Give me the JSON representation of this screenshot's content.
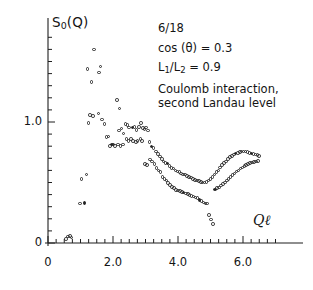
{
  "chart_data": {
    "type": "scatter",
    "title": "",
    "xlabel": "Qℓ",
    "ylabel": "S₀(Q)",
    "xlim": [
      0,
      7.0
    ],
    "ylim": [
      0,
      1.72
    ],
    "grid": false,
    "legend": "none",
    "x_ticks_major": [
      0,
      2.0,
      4.0,
      6.0
    ],
    "x_tick_labels": [
      "0",
      "2.0",
      "4.0",
      "6.0"
    ],
    "x_tick_minor_step": 0.25,
    "y_ticks_major": [
      0,
      1.0
    ],
    "y_tick_labels": [
      "0",
      "1.0"
    ],
    "y_tick_minor_step": 0.1,
    "marker": "open-circle",
    "series": [
      {
        "name": "S0(Q) second Landau level",
        "points": [
          [
            0.56,
            0.035
          ],
          [
            0.62,
            0.055
          ],
          [
            0.68,
            0.06
          ],
          [
            0.72,
            0.045
          ],
          [
            0.99,
            0.325
          ],
          [
            1.12,
            0.33
          ],
          [
            1.03,
            0.53
          ],
          [
            1.18,
            0.565
          ],
          [
            1.25,
            0.99
          ],
          [
            1.3,
            1.06
          ],
          [
            1.38,
            1.05
          ],
          [
            1.22,
            1.44
          ],
          [
            1.34,
            1.33
          ],
          [
            1.42,
            1.6
          ],
          [
            1.57,
            1.41
          ],
          [
            1.62,
            1.46
          ],
          [
            1.55,
            1.07
          ],
          [
            1.66,
            1.02
          ],
          [
            1.74,
            0.985
          ],
          [
            1.8,
            0.875
          ],
          [
            1.86,
            0.88
          ],
          [
            1.9,
            0.8
          ],
          [
            1.97,
            0.815
          ],
          [
            2.02,
            0.815
          ],
          [
            2.07,
            0.8
          ],
          [
            2.12,
            1.18
          ],
          [
            2.2,
            1.11
          ],
          [
            2.18,
            0.93
          ],
          [
            2.26,
            0.945
          ],
          [
            2.32,
            0.905
          ],
          [
            2.16,
            0.815
          ],
          [
            2.23,
            0.8
          ],
          [
            2.3,
            0.815
          ],
          [
            2.38,
            0.985
          ],
          [
            2.44,
            0.975
          ],
          [
            2.5,
            0.955
          ],
          [
            2.42,
            0.86
          ],
          [
            2.48,
            0.845
          ],
          [
            2.55,
            0.86
          ],
          [
            2.6,
            0.955
          ],
          [
            2.66,
            0.96
          ],
          [
            2.72,
            0.935
          ],
          [
            2.62,
            0.845
          ],
          [
            2.7,
            0.835
          ],
          [
            2.76,
            0.845
          ],
          [
            2.8,
            0.96
          ],
          [
            2.86,
            0.99
          ],
          [
            2.92,
            0.95
          ],
          [
            2.84,
            0.86
          ],
          [
            2.9,
            0.845
          ],
          [
            2.97,
            0.94
          ],
          [
            3.02,
            0.955
          ],
          [
            3.08,
            0.93
          ],
          [
            2.98,
            0.655
          ],
          [
            3.04,
            0.645
          ],
          [
            3.12,
            0.835
          ],
          [
            3.18,
            0.8
          ],
          [
            3.24,
            0.785
          ],
          [
            3.14,
            0.69
          ],
          [
            3.2,
            0.675
          ],
          [
            3.28,
            0.655
          ],
          [
            3.32,
            0.755
          ],
          [
            3.38,
            0.735
          ],
          [
            3.44,
            0.715
          ],
          [
            3.34,
            0.62
          ],
          [
            3.4,
            0.6
          ],
          [
            3.46,
            0.585
          ],
          [
            3.5,
            0.695
          ],
          [
            3.56,
            0.675
          ],
          [
            3.62,
            0.66
          ],
          [
            3.52,
            0.545
          ],
          [
            3.58,
            0.53
          ],
          [
            3.64,
            0.515
          ],
          [
            3.68,
            0.655
          ],
          [
            3.74,
            0.635
          ],
          [
            3.8,
            0.62
          ],
          [
            3.7,
            0.495
          ],
          [
            3.76,
            0.48
          ],
          [
            3.82,
            0.465
          ],
          [
            3.86,
            0.615
          ],
          [
            3.92,
            0.6
          ],
          [
            3.98,
            0.59
          ],
          [
            3.88,
            0.455
          ],
          [
            3.94,
            0.44
          ],
          [
            4.0,
            0.435
          ],
          [
            4.04,
            0.585
          ],
          [
            4.1,
            0.575
          ],
          [
            4.16,
            0.565
          ],
          [
            4.06,
            0.43
          ],
          [
            4.12,
            0.42
          ],
          [
            4.18,
            0.415
          ],
          [
            4.22,
            0.565
          ],
          [
            4.28,
            0.555
          ],
          [
            4.34,
            0.545
          ],
          [
            4.24,
            0.41
          ],
          [
            4.3,
            0.405
          ],
          [
            4.36,
            0.395
          ],
          [
            4.4,
            0.54
          ],
          [
            4.46,
            0.53
          ],
          [
            4.52,
            0.52
          ],
          [
            4.42,
            0.39
          ],
          [
            4.48,
            0.385
          ],
          [
            4.54,
            0.375
          ],
          [
            4.58,
            0.515
          ],
          [
            4.64,
            0.51
          ],
          [
            4.7,
            0.505
          ],
          [
            4.6,
            0.37
          ],
          [
            4.66,
            0.355
          ],
          [
            4.72,
            0.345
          ],
          [
            4.76,
            0.5
          ],
          [
            4.82,
            0.5
          ],
          [
            4.88,
            0.505
          ],
          [
            4.78,
            0.335
          ],
          [
            4.84,
            0.325
          ],
          [
            4.9,
            0.325
          ],
          [
            4.94,
            0.515
          ],
          [
            5.0,
            0.53
          ],
          [
            5.06,
            0.545
          ],
          [
            4.96,
            0.23
          ],
          [
            5.02,
            0.195
          ],
          [
            5.08,
            0.155
          ],
          [
            5.12,
            0.565
          ],
          [
            5.18,
            0.585
          ],
          [
            5.24,
            0.6
          ],
          [
            5.14,
            0.44
          ],
          [
            5.2,
            0.455
          ],
          [
            5.26,
            0.46
          ],
          [
            5.3,
            0.625
          ],
          [
            5.36,
            0.645
          ],
          [
            5.42,
            0.66
          ],
          [
            5.32,
            0.475
          ],
          [
            5.38,
            0.49
          ],
          [
            5.44,
            0.5
          ],
          [
            5.48,
            0.675
          ],
          [
            5.54,
            0.695
          ],
          [
            5.6,
            0.71
          ],
          [
            5.5,
            0.515
          ],
          [
            5.56,
            0.53
          ],
          [
            5.62,
            0.545
          ],
          [
            5.66,
            0.72
          ],
          [
            5.72,
            0.73
          ],
          [
            5.78,
            0.74
          ],
          [
            5.68,
            0.56
          ],
          [
            5.74,
            0.575
          ],
          [
            5.8,
            0.59
          ],
          [
            5.84,
            0.745
          ],
          [
            5.9,
            0.75
          ],
          [
            5.96,
            0.755
          ],
          [
            5.86,
            0.6
          ],
          [
            5.92,
            0.615
          ],
          [
            5.98,
            0.625
          ],
          [
            6.02,
            0.755
          ],
          [
            6.08,
            0.755
          ],
          [
            6.14,
            0.75
          ],
          [
            6.04,
            0.635
          ],
          [
            6.1,
            0.645
          ],
          [
            6.16,
            0.655
          ],
          [
            6.2,
            0.745
          ],
          [
            6.26,
            0.74
          ],
          [
            6.32,
            0.735
          ],
          [
            6.22,
            0.66
          ],
          [
            6.28,
            0.665
          ],
          [
            6.34,
            0.67
          ],
          [
            6.38,
            0.73
          ],
          [
            6.44,
            0.725
          ],
          [
            6.5,
            0.72
          ],
          [
            6.4,
            0.675
          ],
          [
            6.46,
            0.68
          ]
        ]
      }
    ],
    "annotations": [
      "6/18",
      "cos(θ) = 0.3",
      "L₁/L₂ = 0.9",
      "Coulomb interaction,",
      "second Landau level"
    ]
  },
  "axes": {
    "y_label_main": "S",
    "y_label_sub": "0",
    "y_label_tail": "(Q)",
    "x_label": "Qℓ"
  },
  "annotation_lines": {
    "line1": "6/18",
    "line2_prefix": "cos (θ) = 0.3",
    "line3_l1": "L",
    "line3_sub1": "1",
    "line3_mid": "/L",
    "line3_sub2": "2",
    "line3_tail": " = 0.9",
    "line4": "Coulomb interaction,",
    "line5": "second Landau level"
  },
  "colors": {
    "marker_open": "#2b2b2b",
    "marker_filled": "#222222",
    "axis": "#1f1f1f",
    "text": "#141414",
    "background": "#ffffff"
  }
}
